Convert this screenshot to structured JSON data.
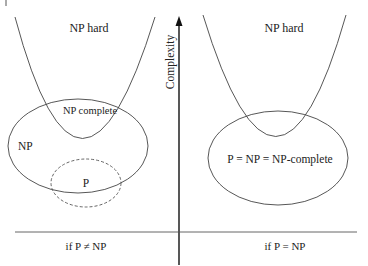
{
  "diagram": {
    "axis": {
      "label": "Complexity"
    },
    "left": {
      "np_hard_label": "NP hard",
      "np_complete_label": "NP complete",
      "np_label": "NP",
      "p_label": "P",
      "caption": "if P ≠ NP"
    },
    "right": {
      "np_hard_label": "NP hard",
      "merged_label": "P = NP = NP-complete",
      "caption": "if P = NP"
    },
    "colors": {
      "stroke": "#333333",
      "text": "#222222",
      "background": "#ffffff"
    }
  }
}
